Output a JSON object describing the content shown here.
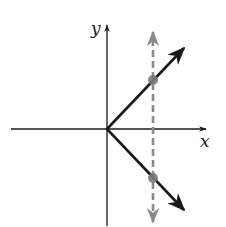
{
  "diagram": {
    "axes": {
      "x_label": "x",
      "y_label": "y",
      "color": "#1a1a1a"
    },
    "graph": {
      "description": "Two rays from origin forming a sideways V (opening right)",
      "color": "#1a1a1a",
      "rays": [
        {
          "name": "upper-ray",
          "from": [
            0,
            0
          ],
          "direction": "up-right"
        },
        {
          "name": "lower-ray",
          "from": [
            0,
            0
          ],
          "direction": "down-right"
        }
      ]
    },
    "vertical_line": {
      "style": "dashed",
      "color": "#8a8a8a",
      "intersections": 2
    },
    "intersection_points": {
      "color": "#7a7a7a",
      "count": 2
    }
  }
}
